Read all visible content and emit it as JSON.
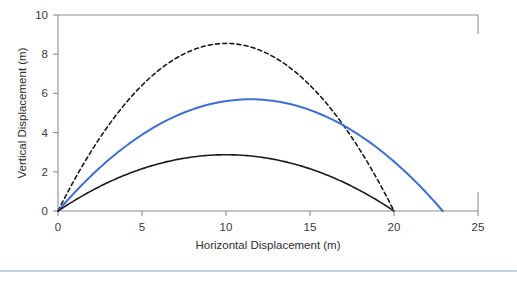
{
  "figure": {
    "background_color": "#ffffff",
    "footer_rule_color": "#c3d2e6"
  },
  "chart_data": {
    "type": "line",
    "title": "",
    "subtitle": "",
    "xlabel": "Horizontal Displacement (m)",
    "ylabel": "Vertical Displacement (m)",
    "xlim": [
      0,
      25
    ],
    "ylim": [
      0,
      10
    ],
    "xticks": [
      0,
      5,
      10,
      15,
      20,
      25
    ],
    "xtick_labels": [
      "0",
      "5",
      "10",
      "15",
      "20",
      "25"
    ],
    "yticks": [
      0,
      2,
      4,
      6,
      8,
      10
    ],
    "ytick_labels": [
      "0",
      "2",
      "4",
      "6",
      "8",
      "10"
    ],
    "grid": false,
    "legend": "none",
    "axis_color": "#8c8c8c",
    "series": [
      {
        "name": "steep-launch-trajectory",
        "style": "dashed",
        "color": "#1a1a1a",
        "linewidth": 1.6,
        "peak": {
          "x": 10.0,
          "y": 8.55
        },
        "range": [
          0.0,
          20.0
        ],
        "x": [
          0.0,
          1.0,
          2.0,
          3.0,
          4.0,
          5.0,
          6.0,
          7.0,
          8.0,
          9.0,
          10.0,
          11.0,
          12.0,
          13.0,
          14.0,
          15.0,
          16.0,
          17.0,
          18.0,
          19.0,
          20.0
        ],
        "y": [
          0.0,
          1.62,
          3.08,
          4.36,
          5.47,
          6.41,
          7.18,
          7.79,
          8.22,
          8.47,
          8.55,
          8.47,
          8.22,
          7.79,
          7.18,
          6.41,
          5.47,
          4.36,
          3.08,
          1.62,
          0.0
        ]
      },
      {
        "name": "medium-launch-trajectory",
        "style": "solid",
        "color": "#3e6fd1",
        "linewidth": 2.0,
        "peak": {
          "x": 11.45,
          "y": 5.7
        },
        "range": [
          0.0,
          22.9
        ],
        "x": [
          0.0,
          1.145,
          2.29,
          3.435,
          4.58,
          5.725,
          6.87,
          8.015,
          9.16,
          10.305,
          11.45,
          12.595,
          13.74,
          14.885,
          16.03,
          17.175,
          18.32,
          19.465,
          20.61,
          21.755,
          22.9
        ],
        "y": [
          0.0,
          1.08,
          2.05,
          2.91,
          3.65,
          4.27,
          4.79,
          5.19,
          5.48,
          5.65,
          5.7,
          5.65,
          5.48,
          5.19,
          4.79,
          4.27,
          3.65,
          2.91,
          2.05,
          1.08,
          0.0
        ]
      },
      {
        "name": "shallow-launch-trajectory",
        "style": "solid",
        "color": "#1a1a1a",
        "linewidth": 1.6,
        "peak": {
          "x": 10.0,
          "y": 2.87
        },
        "range": [
          0.0,
          20.0
        ],
        "x": [
          0.0,
          1.0,
          2.0,
          3.0,
          4.0,
          5.0,
          6.0,
          7.0,
          8.0,
          9.0,
          10.0,
          11.0,
          12.0,
          13.0,
          14.0,
          15.0,
          16.0,
          17.0,
          18.0,
          19.0,
          20.0
        ],
        "y": [
          0.0,
          0.545,
          1.033,
          1.464,
          1.837,
          2.153,
          2.411,
          2.612,
          2.756,
          2.842,
          2.87,
          2.842,
          2.756,
          2.612,
          2.411,
          2.153,
          1.837,
          1.464,
          1.033,
          0.545,
          0.0
        ]
      }
    ]
  }
}
